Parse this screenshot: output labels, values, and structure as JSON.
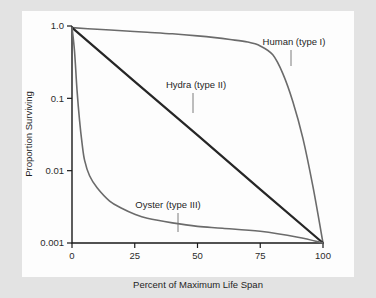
{
  "chart_data": {
    "type": "line",
    "title": "",
    "xlabel": "Percent of Maximum Life Span",
    "ylabel": "Proportion Surviving",
    "x_scale": "linear",
    "y_scale": "log",
    "xlim": [
      0,
      100
    ],
    "ylim": [
      0.001,
      1.0
    ],
    "grid": false,
    "legend_position": "inline-annotations",
    "x_ticks": [
      "0",
      "25",
      "50",
      "75",
      "100"
    ],
    "x_tick_values": [
      0,
      25,
      50,
      75,
      100
    ],
    "y_ticks": [
      "1.0",
      "0.1",
      "0.01",
      "0.001"
    ],
    "y_tick_values": [
      1.0,
      0.1,
      0.01,
      0.001
    ],
    "series": [
      {
        "name": "Human (type I)",
        "color": "#6b6b6b",
        "stroke_width": 1.6,
        "x": [
          0,
          10,
          20,
          30,
          40,
          50,
          57,
          63,
          70,
          75,
          80,
          84,
          88,
          92,
          96,
          100
        ],
        "values": [
          0.95,
          0.9,
          0.86,
          0.82,
          0.78,
          0.73,
          0.69,
          0.65,
          0.6,
          0.53,
          0.4,
          0.22,
          0.09,
          0.028,
          0.006,
          0.001
        ]
      },
      {
        "name": "Hydra (type II)",
        "color": "#262626",
        "stroke_width": 2.2,
        "x": [
          0,
          25,
          50,
          75,
          100
        ],
        "values": [
          0.95,
          0.17,
          0.031,
          0.0055,
          0.001
        ]
      },
      {
        "name": "Oyster (type III)",
        "color": "#6b6b6b",
        "stroke_width": 1.6,
        "x": [
          0,
          1,
          2,
          3,
          4,
          5,
          7,
          10,
          15,
          20,
          25,
          30,
          40,
          50,
          60,
          75,
          90,
          100
        ],
        "values": [
          0.95,
          0.45,
          0.13,
          0.05,
          0.024,
          0.014,
          0.0085,
          0.0058,
          0.0038,
          0.003,
          0.0025,
          0.0022,
          0.0019,
          0.0017,
          0.0016,
          0.00145,
          0.0012,
          0.001
        ]
      }
    ],
    "annotations": [
      {
        "text": "Human (type I)",
        "label_x": 294,
        "label_y": 45,
        "leader_from_x": 291,
        "leader_from_y": 50,
        "leader_to_x": 291,
        "leader_to_y": 66
      },
      {
        "text": "Hydra (type II)",
        "label_x": 196,
        "label_y": 88,
        "leader_from_x": 193,
        "leader_from_y": 93,
        "leader_to_x": 193,
        "leader_to_y": 113
      },
      {
        "text": "Oyster (type III)",
        "label_x": 168,
        "label_y": 208,
        "leader_from_x": 178,
        "leader_from_y": 213,
        "leader_to_x": 178,
        "leader_to_y": 232
      }
    ]
  },
  "plot_geometry": {
    "left": 72,
    "right": 323,
    "top": 26,
    "bottom": 243
  },
  "colors": {
    "page_background": "#e3e3e3",
    "panel_background": "#fdfdfd",
    "axis": "#1a1a1a",
    "text": "#1f1f1f",
    "curve_gray": "#6b6b6b",
    "curve_dark": "#262626",
    "leader": "#6e6e6e"
  }
}
